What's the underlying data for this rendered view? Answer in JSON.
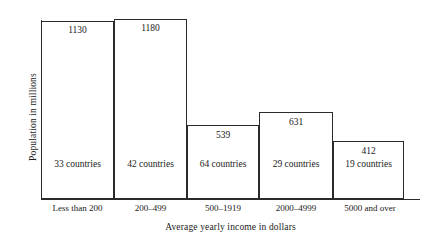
{
  "chart_data": {
    "type": "bar",
    "title": "",
    "xlabel": "Average yearly income in dollars",
    "ylabel": "Population in millions",
    "categories": [
      "Less than 200",
      "200–499",
      "500–1919",
      "2000–4999",
      "5000 and over"
    ],
    "values": [
      1130,
      1180,
      539,
      631,
      412
    ],
    "value_labels": [
      "1130",
      "1180",
      "539",
      "631",
      "412"
    ],
    "secondary_labels": [
      "33 countries",
      "42 countries",
      "64 countries",
      "29 countries",
      "19 countries"
    ],
    "secondary_values": [
      33,
      42,
      64,
      29,
      19
    ],
    "series": [
      {
        "name": "Population in millions",
        "values": [
          1130,
          1180,
          539,
          631,
          412
        ]
      },
      {
        "name": "Number of countries",
        "values": [
          33,
          42,
          64,
          29,
          19
        ]
      }
    ],
    "ylim": [
      0,
      1180
    ],
    "grid": false,
    "legend": "none",
    "bar_widths_unequal": true,
    "bar_fill": "none",
    "bar_outline_color": "#2a2a2a",
    "background_color": "#ffffff",
    "axis_color": "#2a2a2a"
  },
  "bars": [
    {
      "category": "Less than 200",
      "value_label": "1130",
      "count_label": "33 countries",
      "left": 41,
      "width": 73,
      "top": 21,
      "height": 178,
      "value_label_top": 25,
      "count_label_top": 159,
      "tick_left": 41,
      "tick_width": 73
    },
    {
      "category": "200–499",
      "value_label": "1180",
      "count_label": "42 countries",
      "left": 114,
      "width": 73,
      "top": 19,
      "height": 180,
      "value_label_top": 23,
      "count_label_top": 159,
      "tick_left": 114,
      "tick_width": 73
    },
    {
      "category": "500–1919",
      "value_label": "539",
      "count_label": "64 countries",
      "left": 187,
      "width": 72,
      "top": 125,
      "height": 74,
      "value_label_top": 130,
      "count_label_top": 159,
      "tick_left": 187,
      "tick_width": 72
    },
    {
      "category": "2000–4999",
      "value_label": "631",
      "count_label": "29 countries",
      "left": 259,
      "width": 74,
      "top": 112,
      "height": 87,
      "value_label_top": 117,
      "count_label_top": 159,
      "tick_left": 259,
      "tick_width": 74
    },
    {
      "category": "5000 and over",
      "value_label": "412",
      "count_label": "19 countries",
      "left": 333,
      "width": 71,
      "top": 141,
      "height": 58,
      "value_label_top": 146,
      "count_label_top": 159,
      "tick_left": 331,
      "tick_width": 78
    }
  ]
}
